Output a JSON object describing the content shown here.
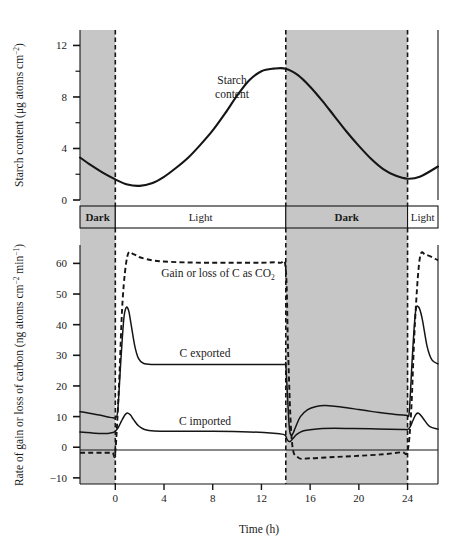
{
  "figure": {
    "background_color": "#ffffff",
    "shade_color": "#c6c6c6",
    "line_color": "#151515"
  },
  "top_panel": {
    "y_axis_title_main": "Starch content (",
    "y_axis_title_unit_mu": "μg atoms cm",
    "y_axis_title_exp": "−2",
    "y_axis_title_close": ")",
    "y_ticks": [
      "0",
      "4",
      "8",
      "12"
    ],
    "y_tick_values": [
      0,
      4,
      8,
      12
    ],
    "y_minor_step": 2,
    "annotation_line1": "Starch",
    "annotation_line2": "content"
  },
  "phase_bar": {
    "segments": [
      {
        "label": "Dark",
        "type": "dark",
        "start": -2.9,
        "end": 0
      },
      {
        "label": "Light",
        "type": "light",
        "start": 0,
        "end": 14
      },
      {
        "label": "Dark",
        "type": "dark",
        "start": 14,
        "end": 24
      },
      {
        "label": "Light",
        "type": "light",
        "start": 24,
        "end": 26.5
      }
    ]
  },
  "bottom_panel": {
    "y_axis_title_a": "Rate of gain or loss of carbon (ng atoms cm",
    "y_axis_title_exp1": "−2",
    "y_axis_title_b": " min",
    "y_axis_title_exp2": "−1",
    "y_axis_title_close": ")",
    "y_ticks": [
      "−10",
      "0",
      "10",
      "20",
      "30",
      "40",
      "50",
      "60"
    ],
    "y_tick_values": [
      -10,
      0,
      10,
      20,
      30,
      40,
      50,
      60
    ],
    "annotation_co2_a": "Gain or loss of C as CO",
    "annotation_co2_sub": "2",
    "annotation_exported": "C exported",
    "annotation_imported": "C imported"
  },
  "x_axis": {
    "title": "Time  (h)",
    "ticks": [
      "0",
      "4",
      "8",
      "12",
      "16",
      "20",
      "24"
    ],
    "tick_values": [
      0,
      4,
      8,
      12,
      16,
      20,
      24
    ],
    "range": [
      -2.9,
      26.5
    ]
  },
  "chart_data": {
    "type": "line",
    "xlabel": "Time  (h)",
    "xlim": [
      -2.9,
      26.5
    ],
    "x_ticks": [
      0,
      4,
      8,
      12,
      16,
      20,
      24
    ],
    "grid": false,
    "legend": "inline annotations",
    "panels": [
      {
        "name": "top",
        "ylabel": "Starch content (μg atoms cm−2)",
        "ylim": [
          0,
          13.2
        ],
        "y_ticks": [
          0,
          4,
          8,
          12
        ],
        "series": [
          {
            "name": "Starch content",
            "style": "solid",
            "x": [
              -2.9,
              -2.0,
              -1.0,
              0.0,
              1.0,
              2.0,
              3.0,
              4.0,
              5.0,
              6.0,
              7.0,
              8.0,
              9.0,
              10.0,
              11.0,
              12.0,
              13.0,
              14.0,
              15.0,
              16.0,
              17.0,
              18.0,
              19.0,
              20.0,
              21.0,
              22.0,
              23.0,
              24.0,
              25.0,
              26.5
            ],
            "y": [
              3.3,
              2.7,
              2.1,
              1.6,
              1.2,
              1.1,
              1.3,
              1.8,
              2.5,
              3.3,
              4.3,
              5.4,
              6.7,
              8.1,
              9.3,
              10.0,
              10.2,
              10.2,
              9.7,
              8.8,
              7.7,
              6.5,
              5.3,
              4.2,
              3.2,
              2.4,
              1.9,
              1.65,
              1.8,
              2.6
            ]
          }
        ]
      },
      {
        "name": "bottom",
        "ylabel": "Rate of gain or loss of carbon (ng atoms cm−2 min−1)",
        "ylim": [
          -12,
          66
        ],
        "y_ticks": [
          -10,
          0,
          10,
          20,
          30,
          40,
          50,
          60
        ],
        "series": [
          {
            "name": "Gain or loss of C as CO2",
            "style": "dashed",
            "x": [
              -2.9,
              -2.0,
              -1.0,
              -0.25,
              0.0,
              0.3,
              0.6,
              1.0,
              1.5,
              2.0,
              3.0,
              4.0,
              6.0,
              8.0,
              10.0,
              12.0,
              13.5,
              14.0,
              14.2,
              14.5,
              15.0,
              16.0,
              18.0,
              20.0,
              22.0,
              23.5,
              24.0,
              24.3,
              24.6,
              25.0,
              25.5,
              26.5
            ],
            "y": [
              -1.8,
              -1.8,
              -1.8,
              -1.8,
              -1.5,
              20.0,
              48.0,
              62.5,
              63.0,
              62.0,
              61.0,
              60.6,
              60.3,
              60.2,
              60.2,
              60.2,
              60.2,
              58.0,
              30.0,
              2.0,
              -3.3,
              -3.6,
              -3.2,
              -2.8,
              -2.3,
              -1.6,
              -1.2,
              12.0,
              40.0,
              61.5,
              62.8,
              61.0
            ]
          },
          {
            "name": "C exported",
            "style": "solid",
            "x": [
              -2.9,
              -2.0,
              -1.2,
              -0.5,
              -0.2,
              0.0,
              0.2,
              0.45,
              0.7,
              0.9,
              1.1,
              1.3,
              1.6,
              1.9,
              2.3,
              3.0,
              5.0,
              8.0,
              11.0,
              13.0,
              13.9,
              14.0,
              14.15,
              14.3,
              14.5,
              14.8,
              15.2,
              15.8,
              16.5,
              17.2,
              18.0,
              19.0,
              20.0,
              21.0,
              22.0,
              23.0,
              23.9,
              24.0,
              24.15,
              24.4,
              24.65,
              24.9,
              25.2,
              25.6,
              26.0,
              26.5
            ],
            "y": [
              11.6,
              11.0,
              10.4,
              9.8,
              9.6,
              9.7,
              12.0,
              28.0,
              42.0,
              45.6,
              44.5,
              40.0,
              33.0,
              29.0,
              27.4,
              27.0,
              27.0,
              27.0,
              27.0,
              27.0,
              27.0,
              26.8,
              16.0,
              6.0,
              4.0,
              6.5,
              10.0,
              12.3,
              13.3,
              13.6,
              13.4,
              12.9,
              12.3,
              11.7,
              11.2,
              10.7,
              10.4,
              10.3,
              12.0,
              30.0,
              44.0,
              45.8,
              42.0,
              33.0,
              28.5,
              27.2
            ]
          },
          {
            "name": "C imported",
            "style": "solid",
            "x": [
              -2.9,
              -2.0,
              -1.2,
              -0.6,
              -0.2,
              0.0,
              0.25,
              0.5,
              0.8,
              1.0,
              1.25,
              1.5,
              1.9,
              2.4,
              3.2,
              5.0,
              8.0,
              11.0,
              13.0,
              13.8,
              14.0,
              14.1,
              14.25,
              14.4,
              14.6,
              14.9,
              15.4,
              16.0,
              17.0,
              18.0,
              19.5,
              21.0,
              22.5,
              23.6,
              24.0,
              24.2,
              24.45,
              24.7,
              24.95,
              25.3,
              25.8,
              26.5
            ],
            "y": [
              5.0,
              4.7,
              4.5,
              4.5,
              4.8,
              5.2,
              6.5,
              8.5,
              10.6,
              11.2,
              10.5,
              9.0,
              7.0,
              5.8,
              5.3,
              5.2,
              5.2,
              5.0,
              4.6,
              4.2,
              3.6,
              2.6,
              1.9,
              2.0,
              2.9,
              4.2,
              5.3,
              5.7,
              6.1,
              6.2,
              6.1,
              6.0,
              5.9,
              5.8,
              5.8,
              6.6,
              8.8,
              10.8,
              11.0,
              9.3,
              6.8,
              5.9
            ]
          }
        ]
      }
    ],
    "dark_periods": [
      {
        "start": -2.9,
        "end": 0
      },
      {
        "start": 14,
        "end": 24
      }
    ],
    "light_periods": [
      {
        "start": 0,
        "end": 14
      },
      {
        "start": 24,
        "end": 26.5
      }
    ]
  }
}
